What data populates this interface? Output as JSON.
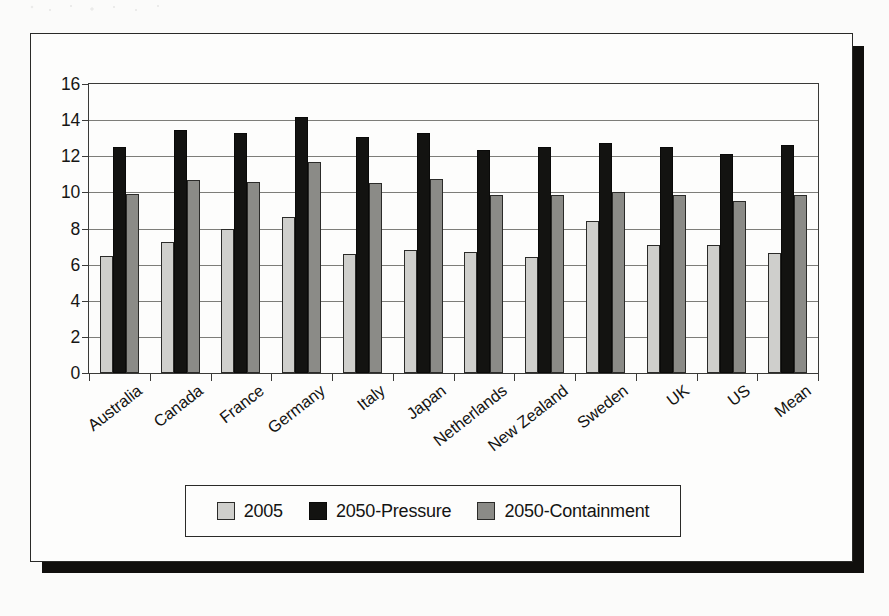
{
  "chart_data": {
    "type": "bar",
    "title": "",
    "subtitle": "",
    "xlabel": "",
    "ylabel": "",
    "ylim": [
      0,
      16
    ],
    "ytick_step": 2,
    "yticks": [
      "16",
      "14",
      "12",
      "10",
      "8",
      "6",
      "4",
      "2",
      "0"
    ],
    "grid": true,
    "legend_position": "bottom-center",
    "categories": [
      "Australia",
      "Canada",
      "France",
      "Germany",
      "Italy",
      "Japan",
      "Netherlands",
      "New Zealand",
      "Sweden",
      "UK",
      "US",
      "Mean"
    ],
    "series": [
      {
        "name": "2005",
        "color": "#cfcfcc",
        "values": [
          6.5,
          7.25,
          8.0,
          8.65,
          6.6,
          6.8,
          6.7,
          6.4,
          8.4,
          7.1,
          7.1,
          6.65
        ]
      },
      {
        "name": "2050-Pressure",
        "color": "#131311",
        "values": [
          12.5,
          13.45,
          13.3,
          14.2,
          13.05,
          13.3,
          12.35,
          12.5,
          12.75,
          12.5,
          12.15,
          12.65
        ]
      },
      {
        "name": "2050-Containment",
        "color": "#8b8b87",
        "values": [
          9.9,
          10.7,
          10.6,
          11.7,
          10.5,
          10.75,
          9.85,
          9.85,
          10.0,
          9.85,
          9.55,
          9.85
        ]
      }
    ]
  },
  "legend": {
    "items": [
      {
        "label": "2005"
      },
      {
        "label": "2050-Pressure"
      },
      {
        "label": "2050-Containment"
      }
    ]
  }
}
